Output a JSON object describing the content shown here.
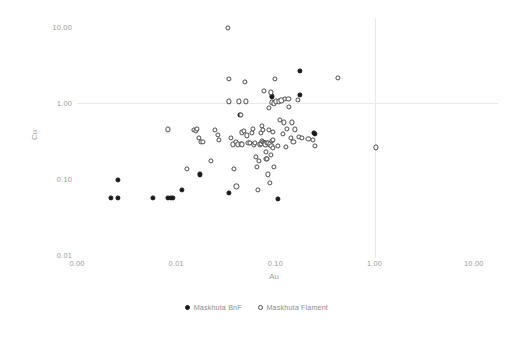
{
  "chart_data": {
    "type": "scatter",
    "title": "",
    "xlabel": "Au",
    "ylabel": "Cu",
    "xscale": "log",
    "yscale": "log",
    "xlim": [
      0.001,
      10.0
    ],
    "ylim": [
      0.01,
      10.0
    ],
    "xticks": [
      "0.00",
      "0.01",
      "0.10",
      "1.00",
      "10.00"
    ],
    "xtick_values": [
      0.001,
      0.01,
      0.1,
      1.0,
      10.0
    ],
    "yticks": [
      "0.01",
      "0.10",
      "1.00",
      "10.00"
    ],
    "ytick_values": [
      0.01,
      0.1,
      1.0,
      10.0
    ],
    "grid": "major gridlines at Cu=1.00 (horizontal) and Au=1.00 (vertical)",
    "legend_position": "bottom-center",
    "series": [
      {
        "name": "Maskhuta BnF",
        "marker": "filled-circle",
        "color": "#1a1a1a",
        "points": [
          [
            0.0022,
            0.057
          ],
          [
            0.0026,
            0.057
          ],
          [
            0.0026,
            0.097
          ],
          [
            0.0058,
            0.057
          ],
          [
            0.0082,
            0.057
          ],
          [
            0.0088,
            0.057
          ],
          [
            0.0092,
            0.057
          ],
          [
            0.0115,
            0.072
          ],
          [
            0.0175,
            0.115
          ],
          [
            0.034,
            0.065
          ],
          [
            0.044,
            0.7
          ],
          [
            0.092,
            1.22
          ],
          [
            0.105,
            0.055
          ],
          [
            0.175,
            2.65
          ],
          [
            0.178,
            1.28
          ],
          [
            0.245,
            0.4
          ],
          [
            0.252,
            0.395
          ]
        ]
      },
      {
        "name": "Maskhuta Flament",
        "marker": "open-circle",
        "color": "#4a4a4a",
        "points": [
          [
            0.0082,
            0.45
          ],
          [
            0.0128,
            0.135
          ],
          [
            0.0152,
            0.44
          ],
          [
            0.0158,
            0.43
          ],
          [
            0.0162,
            0.455
          ],
          [
            0.0168,
            0.345
          ],
          [
            0.0178,
            0.305
          ],
          [
            0.0185,
            0.305
          ],
          [
            0.0222,
            0.175
          ],
          [
            0.0245,
            0.445
          ],
          [
            0.0262,
            0.385
          ],
          [
            0.0268,
            0.325
          ],
          [
            0.0335,
            9.8
          ],
          [
            0.0338,
            1.05
          ],
          [
            0.0342,
            2.05
          ],
          [
            0.0358,
            0.345
          ],
          [
            0.0372,
            0.285
          ],
          [
            0.0385,
            0.135
          ],
          [
            0.0398,
            0.305
          ],
          [
            0.0405,
            0.08
          ],
          [
            0.0415,
            0.285
          ],
          [
            0.0432,
            1.05
          ],
          [
            0.0445,
            0.29
          ],
          [
            0.0452,
            0.7
          ],
          [
            0.0458,
            0.285
          ],
          [
            0.0462,
            0.41
          ],
          [
            0.0478,
            0.43
          ],
          [
            0.0495,
            1.9
          ],
          [
            0.0505,
            1.05
          ],
          [
            0.052,
            0.375
          ],
          [
            0.0535,
            0.295
          ],
          [
            0.0555,
            0.295
          ],
          [
            0.058,
            0.4
          ],
          [
            0.0595,
            0.46
          ],
          [
            0.0612,
            0.285
          ],
          [
            0.0625,
            0.295
          ],
          [
            0.0635,
            0.195
          ],
          [
            0.0648,
            0.145
          ],
          [
            0.0662,
            0.072
          ],
          [
            0.068,
            0.175
          ],
          [
            0.0695,
            0.285
          ],
          [
            0.071,
            0.405
          ],
          [
            0.0718,
            0.29
          ],
          [
            0.0725,
            0.5
          ],
          [
            0.0738,
            0.315
          ],
          [
            0.0745,
            0.44
          ],
          [
            0.0752,
            0.305
          ],
          [
            0.0762,
            1.45
          ],
          [
            0.0775,
            0.3
          ],
          [
            0.0785,
            0.295
          ],
          [
            0.0792,
            0.285
          ],
          [
            0.0805,
            0.225
          ],
          [
            0.0812,
            0.185
          ],
          [
            0.082,
            0.185
          ],
          [
            0.0828,
            0.3
          ],
          [
            0.0838,
            0.115
          ],
          [
            0.0848,
            0.3
          ],
          [
            0.0855,
            0.86
          ],
          [
            0.0862,
            0.44
          ],
          [
            0.0875,
            0.285
          ],
          [
            0.0885,
            0.088
          ],
          [
            0.0895,
            1.38
          ],
          [
            0.0905,
            0.205
          ],
          [
            0.0912,
            0.275
          ],
          [
            0.0918,
            0.315
          ],
          [
            0.0925,
            1.02
          ],
          [
            0.0935,
            0.42
          ],
          [
            0.0942,
            0.255
          ],
          [
            0.0952,
            0.325
          ],
          [
            0.0962,
            0.145
          ],
          [
            0.0975,
            0.985
          ],
          [
            0.0985,
            2.05
          ],
          [
            0.102,
            1.05
          ],
          [
            0.105,
            0.275
          ],
          [
            0.108,
            1.05
          ],
          [
            0.112,
            0.6
          ],
          [
            0.115,
            1.08
          ],
          [
            0.118,
            0.395
          ],
          [
            0.121,
            0.555
          ],
          [
            0.124,
            1.12
          ],
          [
            0.128,
            0.265
          ],
          [
            0.131,
            0.46
          ],
          [
            0.135,
            1.12
          ],
          [
            0.138,
            0.88
          ],
          [
            0.142,
            0.345
          ],
          [
            0.148,
            0.555
          ],
          [
            0.152,
            0.305
          ],
          [
            0.158,
            0.45
          ],
          [
            0.168,
            1.1
          ],
          [
            0.172,
            0.355
          ],
          [
            0.185,
            0.345
          ],
          [
            0.215,
            0.335
          ],
          [
            0.238,
            0.325
          ],
          [
            0.252,
            0.275
          ],
          [
            0.425,
            2.15
          ],
          [
            1.04,
            0.26
          ]
        ]
      }
    ]
  },
  "axes": {
    "y_title": "Cu",
    "x_title": "Au"
  },
  "legend": {
    "entries": [
      {
        "label": "Maskhuta BnF",
        "marker": "filled-circle"
      },
      {
        "label": "Maskhuta Flament",
        "marker": "open-circle"
      }
    ]
  },
  "artifact": {
    "text": ""
  }
}
